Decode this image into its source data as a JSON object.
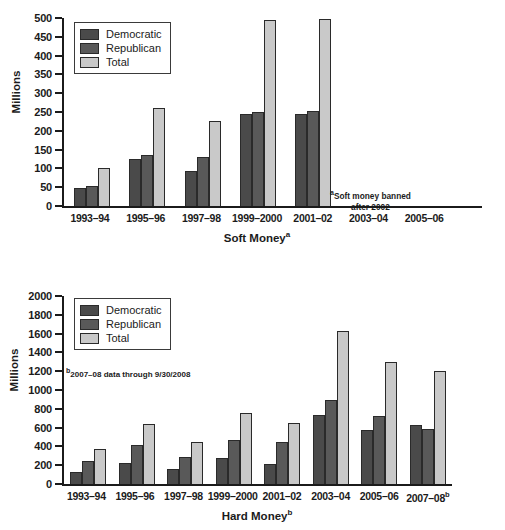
{
  "chart_data": [
    {
      "type": "bar",
      "title": "Soft Money",
      "title_superscript": "a",
      "xlabel": "Soft Money",
      "ylabel": "Millions",
      "ylim": [
        0,
        500
      ],
      "yticks": [
        0,
        50,
        100,
        150,
        200,
        250,
        300,
        350,
        400,
        450,
        500
      ],
      "grid": false,
      "legend_position": "top-left",
      "categories": [
        "1993–94",
        "1995–96",
        "1997–98",
        "1999–2000",
        "2001–02",
        "2003–04",
        "2005–06"
      ],
      "series": [
        {
          "name": "Democratic",
          "color": "#4a4a4a",
          "values": [
            49,
            125,
            94,
            246,
            246,
            null,
            null
          ]
        },
        {
          "name": "Republican",
          "color": "#595959",
          "values": [
            52,
            137,
            131,
            249,
            252,
            null,
            null
          ]
        },
        {
          "name": "Total",
          "color": "#c9c9c9",
          "values": [
            101,
            262,
            225,
            495,
            498,
            null,
            null
          ]
        }
      ],
      "annotations": [
        {
          "text_superscript": "a",
          "line1": "Soft money banned",
          "line2": "after 2002"
        }
      ]
    },
    {
      "type": "bar",
      "title": "Hard Money",
      "title_superscript": "b",
      "xlabel": "Hard Money",
      "ylabel": "Millions",
      "ylim": [
        0,
        2000
      ],
      "yticks": [
        0,
        200,
        400,
        600,
        800,
        1000,
        1200,
        1400,
        1600,
        1800,
        2000
      ],
      "grid": false,
      "legend_position": "top-left",
      "categories": [
        "1993–94",
        "1995–96",
        "1997–98",
        "1999–2000",
        "2001–02",
        "2003–04",
        "2005–06",
        "2007–08"
      ],
      "categories_superscripts": [
        "",
        "",
        "",
        "",
        "",
        "",
        "",
        "b"
      ],
      "series": [
        {
          "name": "Democratic",
          "color": "#4a4a4a",
          "values": [
            128,
            221,
            158,
            274,
            214,
            735,
            578,
            624
          ]
        },
        {
          "name": "Republican",
          "color": "#595959",
          "values": [
            240,
            416,
            288,
            465,
            442,
            893,
            721,
            588
          ]
        },
        {
          "name": "Total",
          "color": "#c9c9c9",
          "values": [
            372,
            634,
            444,
            754,
            651,
            1624,
            1300,
            1205
          ]
        }
      ],
      "annotations": [
        {
          "text_superscript": "b",
          "line1": "2007–08 data through 9/30/2008",
          "line2": ""
        }
      ]
    }
  ],
  "top": {
    "ylabel": "Millions",
    "yticks": [
      "500",
      "450",
      "400",
      "350",
      "300",
      "250",
      "200",
      "150",
      "100",
      "50",
      "0"
    ],
    "xlabels": [
      "1993–94",
      "1995–96",
      "1997–98",
      "1999–2000",
      "2001–02",
      "2003–04",
      "2005–06"
    ],
    "xtitle": "Soft Money",
    "xtitle_sup": "a",
    "legend": [
      {
        "label": "Democratic",
        "key": "dem"
      },
      {
        "label": "Republican",
        "key": "rep"
      },
      {
        "label": "Total",
        "key": "total"
      }
    ],
    "note": {
      "sup": "a",
      "line1": "Soft money banned",
      "line2": "after 2002"
    }
  },
  "bottom": {
    "ylabel": "Millions",
    "yticks": [
      "2000",
      "1800",
      "1600",
      "1400",
      "1200",
      "1000",
      "800",
      "600",
      "400",
      "200",
      "0"
    ],
    "xlabels": [
      "1993–94",
      "1995–96",
      "1997–98",
      "1999–2000",
      "2001–02",
      "2003–04",
      "2005–06",
      "2007–08"
    ],
    "xlabel_sup_last": "b",
    "xtitle": "Hard Money",
    "xtitle_sup": "b",
    "legend": [
      {
        "label": "Democratic",
        "key": "dem"
      },
      {
        "label": "Republican",
        "key": "rep"
      },
      {
        "label": "Total",
        "key": "total"
      }
    ],
    "note": {
      "sup": "b",
      "line1": "2007–08 data through 9/30/2008"
    }
  }
}
